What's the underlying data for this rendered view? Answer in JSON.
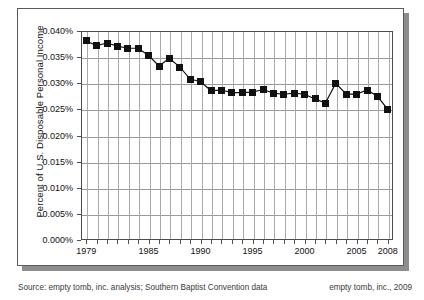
{
  "figure": {
    "clipped_title": "",
    "footer_left": "Source: empty tomb, inc. analysis; Southern Baptist Convention data",
    "footer_right": "empty tomb, inc., 2009"
  },
  "chart_data": {
    "type": "line",
    "title": "",
    "xlabel": "",
    "ylabel": "Percent of U.S. Disposable Personal Income",
    "xlim": [
      1978.5,
      2008.5
    ],
    "ylim": [
      0.0,
      0.04
    ],
    "grid": true,
    "legend": "none",
    "marker": "filled-square",
    "line_color": "#111111",
    "marker_color": "#111111",
    "y_tick_labels": [
      "0.000%",
      "0.005%",
      "0.010%",
      "0.015%",
      "0.020%",
      "0.025%",
      "0.030%",
      "0.035%",
      "0.040%"
    ],
    "y_tick_values": [
      0.0,
      0.005,
      0.01,
      0.015,
      0.02,
      0.025,
      0.03,
      0.035,
      0.04
    ],
    "x_tick_labels": [
      "1979",
      "1985",
      "1990",
      "1995",
      "2000",
      "2005",
      "2008"
    ],
    "x_tick_values": [
      1979,
      1985,
      1990,
      1995,
      2000,
      2005,
      2008
    ],
    "x": [
      1979,
      1980,
      1981,
      1982,
      1983,
      1984,
      1985,
      1986,
      1987,
      1988,
      1989,
      1990,
      1991,
      1992,
      1993,
      1994,
      1995,
      1996,
      1997,
      1998,
      1999,
      2000,
      2001,
      2002,
      2003,
      2004,
      2005,
      2006,
      2007,
      2008
    ],
    "values": [
      0.0381,
      0.0372,
      0.0377,
      0.0371,
      0.0367,
      0.0367,
      0.0353,
      0.0333,
      0.0348,
      0.0331,
      0.0308,
      0.0303,
      0.0286,
      0.0287,
      0.0282,
      0.0282,
      0.0283,
      0.0288,
      0.0281,
      0.0279,
      0.0281,
      0.0279,
      0.027,
      0.0262,
      0.03,
      0.0279,
      0.0279,
      0.0287,
      0.0275,
      0.025
    ]
  }
}
